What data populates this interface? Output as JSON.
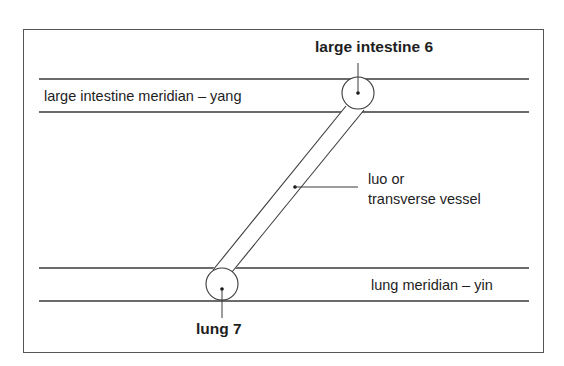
{
  "diagram": {
    "title_labels": {
      "large_intestine_point": "large intestine 6",
      "lung_point": "lung 7"
    },
    "meridians": [
      {
        "name": "large intestine meridian – yang",
        "position": "top"
      },
      {
        "name": "lung meridian – yin",
        "position": "bottom"
      }
    ],
    "vessel_label_line1": "luo or",
    "vessel_label_line2": "transverse vessel",
    "colors": {
      "stroke": "#3a3a3a",
      "text": "#1e1e1e",
      "background": "#ffffff"
    }
  }
}
